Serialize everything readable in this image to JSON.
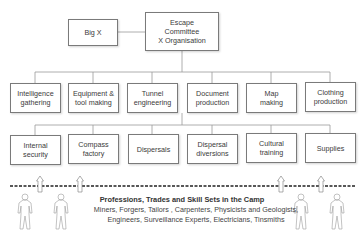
{
  "top": {
    "big_x": "Big X",
    "committee": "Escape\nCommittee\nX Organisation"
  },
  "row1": [
    "Intelligence\ngathering",
    "Equipment &\ntool making",
    "Tunnel\nengineering",
    "Document\nproduction",
    "Map\nmaking",
    "Clothing\nproduction"
  ],
  "row2": [
    "Internal\nsecurity",
    "Compass\nfactory",
    "Dispersals",
    "Dispersal\ndiversions",
    "Cultural\ntraining",
    "Supplies"
  ],
  "base": {
    "title": "Professions, Trades and Skill Sets in the Camp",
    "line1": "Miners, Forgers, Tailors , Carpenters, Physicists and Geologists,",
    "line2": "Engineers, Surveillance Experts, Electricians, Tinsmiths"
  },
  "icons": [
    "arrow-up-icon",
    "person-icon"
  ]
}
